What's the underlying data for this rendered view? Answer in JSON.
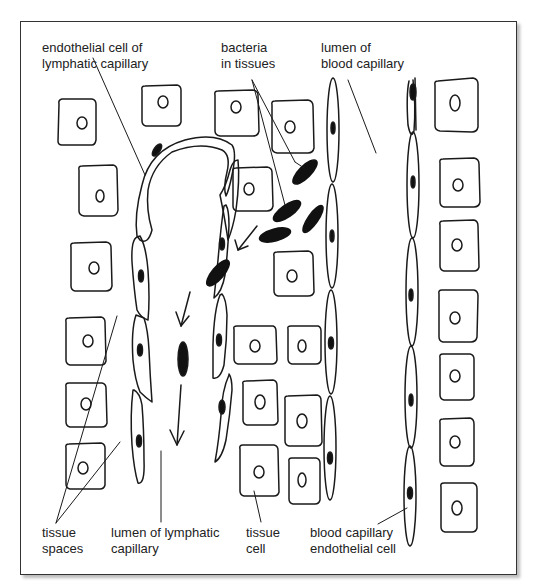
{
  "labels": {
    "endothelial_lymph": [
      "endothelial cell of",
      "lymphatic capillary"
    ],
    "bacteria": [
      "bacteria",
      "in tissues"
    ],
    "lumen_blood": [
      "lumen of",
      "blood capillary"
    ],
    "tissue_spaces": [
      "tissue",
      "spaces"
    ],
    "lumen_lymph": [
      "lumen of lymphatic",
      "capillary"
    ],
    "tissue_cell": [
      "tissue",
      "cell"
    ],
    "blood_endothelial": [
      "blood capillary",
      "endothelial cell"
    ]
  },
  "colors": {
    "line": "#1a1a1a",
    "fill": "#111111",
    "frame": "#333333"
  }
}
